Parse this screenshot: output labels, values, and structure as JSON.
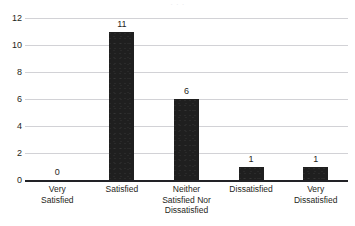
{
  "chart_data": {
    "type": "bar",
    "title": "",
    "xlabel": "",
    "ylabel": "",
    "categories": [
      "Very\nSatisfied",
      "Satisfied",
      "Neither\nSatisfied Nor\nDissatisfied",
      "Dissatisfied",
      "Very\nDissatisfied"
    ],
    "values": [
      0,
      11,
      6,
      1,
      1
    ],
    "value_labels": [
      "0",
      "11",
      "6",
      "1",
      "1"
    ],
    "ylim": [
      0,
      12
    ],
    "yticks": [
      0,
      2,
      4,
      6,
      8,
      10,
      12
    ],
    "ytick_labels": [
      "0",
      "2",
      "4",
      "6",
      "8",
      "10",
      "12"
    ],
    "grid": true,
    "grid_axis": "y",
    "legend": false,
    "legend_position": "none",
    "bar_color": "#1f1f1f",
    "gridline_color": "#d2d2d6",
    "axis_color": "#222226",
    "background_color": "#ffffff"
  },
  "figure": {
    "title_remnant": "· · ·",
    "canvas_label": "bar-chart-canvas"
  }
}
